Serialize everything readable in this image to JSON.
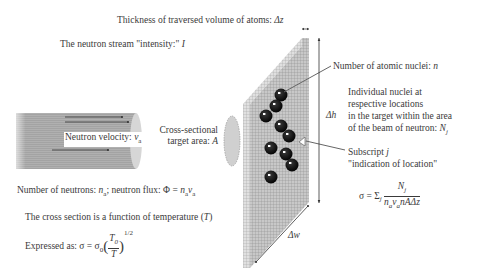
{
  "labels": {
    "thickness": "Thickness of traversed volume of atoms: ",
    "thickness_var": "Δz",
    "intensity": "The neutron stream \"intensity:\" ",
    "intensity_var": "I",
    "velocity": "Neutron velocity: ",
    "velocity_var": "v",
    "velocity_sub": "a",
    "cross_section_line1": "Cross-sectional",
    "cross_section_line2": "target area: ",
    "cross_section_var": "A",
    "nuclei_count": "Number of atomic nuclei: ",
    "nuclei_var": "n",
    "individual_line1": "Individual nuclei at",
    "individual_line2": "respective locations",
    "individual_line3": "in the target within the area",
    "individual_line4": "of the beam of neutron: ",
    "individual_var": "N",
    "individual_sub": "j",
    "dh": "Δh",
    "subscript_line1": "Subscript ",
    "subscript_var": "j",
    "subscript_line2": "\"indication of location\"",
    "neutrons": "Number of neutrons: ",
    "neutrons_var": "n",
    "neutrons_sub": "a",
    "flux_text": "; neutron flux: Φ = ",
    "temperature": "The cross section is a function of temperature (",
    "temperature_var": "T",
    "temperature_close": ")",
    "expressed": "Expressed as: σ = σ",
    "expressed_sub": "0",
    "expressed_num": "T",
    "expressed_num_sub": "0",
    "expressed_den": "T",
    "expressed_exp": "1/2",
    "dw": "Δw",
    "formula_lhs": "σ = Σ",
    "formula_sub": "j",
    "formula_num": "N",
    "formula_num_sub": "j",
    "formula_den": "n",
    "formula_den_a": "a",
    "formula_den_v": "v",
    "formula_den_rest": "nAΔz"
  },
  "colors": {
    "text": "#3a3a3a",
    "slab": "#bdbdbd",
    "cylinder": "#a8a8a8",
    "nucleus": "#111111",
    "ellipse": "#cccccc"
  },
  "nuclei": [
    [
      281,
      95
    ],
    [
      276,
      106
    ],
    [
      265,
      116
    ],
    [
      281,
      126
    ],
    [
      289,
      135
    ],
    [
      271,
      148
    ],
    [
      287,
      153
    ],
    [
      292,
      165
    ],
    [
      271,
      176
    ]
  ]
}
